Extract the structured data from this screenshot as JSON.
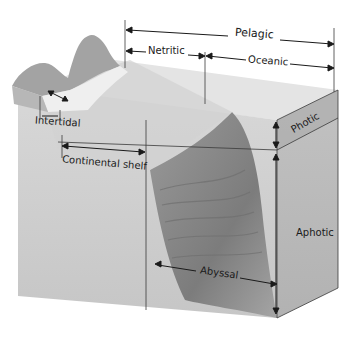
{
  "diagram": {
    "labels": {
      "pelagic": "Pelagic",
      "neritic": "Netritic",
      "oceanic": "Oceanic",
      "intertidal": "Intertidal",
      "continental_shelf": "Continental shelf",
      "photic": "Photic",
      "aphotic": "Aphotic",
      "abyssal": "Abyssal"
    },
    "colors": {
      "front_face": "#cfcfcf",
      "side_face": "#bdbdbd",
      "top_water": "#e6e6e6",
      "land": "#a9a9a9",
      "trench": "#8e8e8e",
      "lines": "#333333"
    }
  }
}
